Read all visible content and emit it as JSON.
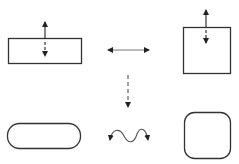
{
  "diagram": {
    "stroke_color": "#333333",
    "arrow_color": "#222222",
    "background": "#ffffff",
    "shapes": [
      {
        "id": "wide-rectangle",
        "kind": "rectangle",
        "x": 8,
        "y": 38,
        "w": 73,
        "h": 25,
        "rx": 0
      },
      {
        "id": "square",
        "kind": "rectangle",
        "x": 183,
        "y": 27,
        "w": 47,
        "h": 46,
        "rx": 0
      },
      {
        "id": "pill",
        "kind": "rounded-rectangle",
        "x": 7,
        "y": 123,
        "w": 73,
        "h": 25,
        "rx": 12
      },
      {
        "id": "rounded-square",
        "kind": "rounded-rectangle",
        "x": 184,
        "y": 112,
        "w": 46,
        "h": 46,
        "rx": 10
      }
    ],
    "arrows": [
      {
        "id": "rect-resize-arrow",
        "kind": "vertical-double",
        "x": 45,
        "y1": 21,
        "y2": 57,
        "dashed_from": 40
      },
      {
        "id": "square-resize-arrow",
        "kind": "vertical-double",
        "x": 206,
        "y1": 9,
        "y2": 44,
        "dashed_from": 28
      },
      {
        "id": "horizontal-transform-arrow",
        "kind": "horizontal-double",
        "x1": 107,
        "x2": 150,
        "y": 50
      },
      {
        "id": "vertical-transform-arrow",
        "kind": "vertical-dashed",
        "x": 128,
        "y1": 75,
        "y2": 108
      },
      {
        "id": "wavy-transform-arrow",
        "kind": "wavy-double",
        "x1": 109,
        "x2": 149,
        "y": 135
      }
    ]
  }
}
